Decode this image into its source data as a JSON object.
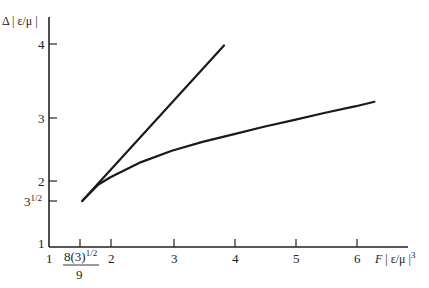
{
  "chart_data": {
    "type": "line",
    "title": "",
    "xlabel": "F | ε/μ |³",
    "ylabel": "Δ | ε/μ |",
    "xlim": [
      1,
      6.8
    ],
    "ylim": [
      1,
      4.5
    ],
    "grid": false,
    "x_ticks": [
      {
        "value": 1,
        "label": "1"
      },
      {
        "value": 1.54,
        "label": "8(3)^1/2 / 9"
      },
      {
        "value": 2,
        "label": "2"
      },
      {
        "value": 3,
        "label": "3"
      },
      {
        "value": 4,
        "label": "4"
      },
      {
        "value": 5,
        "label": "5"
      },
      {
        "value": 6,
        "label": "6"
      }
    ],
    "y_ticks": [
      {
        "value": 1,
        "label": "1"
      },
      {
        "value": 1.732,
        "label": "3^1/2"
      },
      {
        "value": 2,
        "label": "2"
      },
      {
        "value": 3,
        "label": "3"
      },
      {
        "value": 4,
        "label": "4"
      }
    ],
    "series": [
      {
        "name": "straight line",
        "x": [
          1.54,
          3.85
        ],
        "y": [
          1.732,
          3.98
        ]
      },
      {
        "name": "curve",
        "x": [
          1.54,
          1.8,
          2.0,
          2.5,
          3.0,
          3.5,
          4.0,
          4.5,
          5.0,
          5.5,
          6.0,
          6.3
        ],
        "y": [
          1.732,
          1.95,
          2.06,
          2.3,
          2.48,
          2.62,
          2.74,
          2.86,
          2.97,
          3.07,
          3.16,
          3.22
        ]
      }
    ]
  },
  "labels": {
    "ylabel_main": "Δ | ε/μ |",
    "xlabel_F": "F",
    "xlabel_rest": " | ε/μ |",
    "xlabel_exp": "3",
    "x1": "1",
    "x2": "2",
    "x3": "3",
    "x4": "4",
    "x5": "5",
    "x6": "6",
    "xfrac_num": "8(3)",
    "xfrac_exp": "1/2",
    "xfrac_den": "9",
    "y1": "1",
    "y2": "2",
    "y3": "3",
    "y4": "4",
    "ysqrt_base": "3",
    "ysqrt_exp": "1/2"
  }
}
